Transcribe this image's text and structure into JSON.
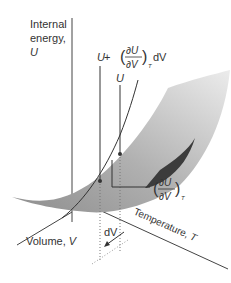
{
  "axes": {
    "vertical": {
      "label_line1": "Internal",
      "label_line2": "energy,",
      "label_symbol": "U"
    },
    "volume": {
      "label": "Volume, ",
      "symbol": "V"
    },
    "temperature": {
      "label": "Temperature, ",
      "symbol": "T"
    }
  },
  "annotations": {
    "upper_point": {
      "prefix": "U",
      "plus": " + ",
      "num": "∂U",
      "den": "∂V",
      "sub": "T",
      "suffix": "dV"
    },
    "lower_point": {
      "label": "U"
    },
    "slope": {
      "num": "∂U",
      "den": "∂V",
      "sub": "T"
    },
    "increment": {
      "label": "dV"
    }
  },
  "colors": {
    "surface_light": "#e6e6e6",
    "surface_mid": "#b4b4b4",
    "surface_dark": "#8c8c8c",
    "underside": "#3c3c3c",
    "line": "#333333"
  }
}
